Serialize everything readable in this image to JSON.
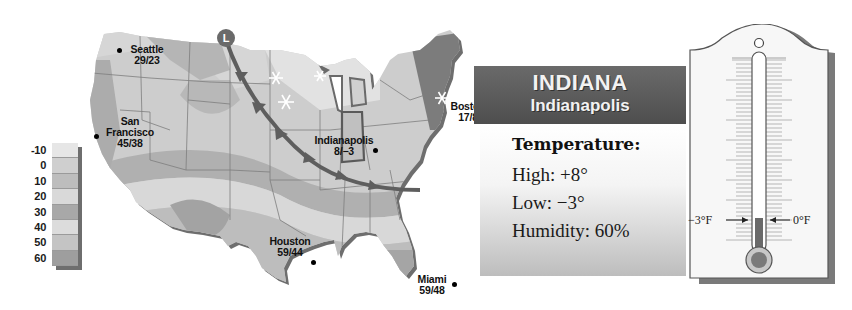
{
  "legend": {
    "title": "",
    "unit": "°F",
    "labels": [
      "-10",
      "0",
      "10",
      "20",
      "30",
      "40",
      "50",
      "60"
    ],
    "colors": [
      "#e6e6e6",
      "#cfcfcf",
      "#bdbdbd",
      "#d9d9d9",
      "#a8a8a8",
      "#dcdcdc",
      "#c4c4c4",
      "#9e9e9e"
    ]
  },
  "map": {
    "region": "United States",
    "low_pressure_symbol": "L",
    "front_type": "cold front",
    "cities": [
      {
        "name": "Seattle",
        "temps": "29/23"
      },
      {
        "name_line1": "San",
        "name_line2": "Francisco",
        "temps": "45/38"
      },
      {
        "name": "Indianapolis",
        "temps": "8/−3"
      },
      {
        "name": "Boston",
        "temps": "17/8"
      },
      {
        "name": "Houston",
        "temps": "59/44"
      },
      {
        "name": "Miami",
        "temps": "59/48"
      }
    ]
  },
  "info": {
    "state": "INDIANA",
    "city": "Indianapolis",
    "heading": "Temperature:",
    "high": "High: +8°",
    "low": "Low: −3°",
    "humidity": "Humidity: 60%"
  },
  "thermometer": {
    "left_label": "−3°F",
    "right_label": "0°F",
    "mercury_color": "#6a6a6a"
  },
  "colors": {
    "banner": "#5a5a5a",
    "front": "#5e5e5e",
    "map_base": "#c9c9c9"
  }
}
